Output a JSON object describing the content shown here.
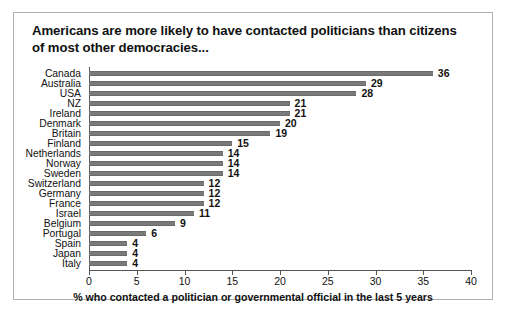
{
  "figure": {
    "title": "Americans are more likely to have contacted politicians than citizens of most other democracies...",
    "border_color": "#b0b0b0",
    "background": "#ffffff"
  },
  "chart_data": {
    "type": "bar",
    "orientation": "horizontal",
    "title": "Americans are more likely to have contacted politicians than citizens of most other democracies...",
    "xlabel": "% who contacted a politician or governmental official in the last 5 years",
    "ylabel": "",
    "xlim": [
      0,
      40
    ],
    "xticks": [
      0,
      5,
      10,
      15,
      20,
      25,
      30,
      35,
      40
    ],
    "xtick_labels": [
      "0",
      "5",
      "10",
      "15",
      "20",
      "25",
      "30",
      "35",
      "40"
    ],
    "grid": false,
    "legend": null,
    "bar_color": "#7a7a7a",
    "data_labels": true,
    "categories": [
      "Canada",
      "Australia",
      "USA",
      "NZ",
      "Ireland",
      "Denmark",
      "Britain",
      "Finland",
      "Netherlands",
      "Norway",
      "Sweden",
      "Switzerland",
      "Germany",
      "France",
      "Israel",
      "Belgium",
      "Portugal",
      "Spain",
      "Japan",
      "Italy"
    ],
    "values": [
      36,
      29,
      28,
      21,
      21,
      20,
      19,
      15,
      14,
      14,
      14,
      12,
      12,
      12,
      11,
      9,
      6,
      4,
      4,
      4
    ],
    "value_labels": [
      "36",
      "29",
      "28",
      "21",
      "21",
      "20",
      "19",
      "15",
      "14",
      "14",
      "14",
      "12",
      "12",
      "12",
      "11",
      "9",
      "6",
      "4",
      "4",
      "4"
    ]
  }
}
